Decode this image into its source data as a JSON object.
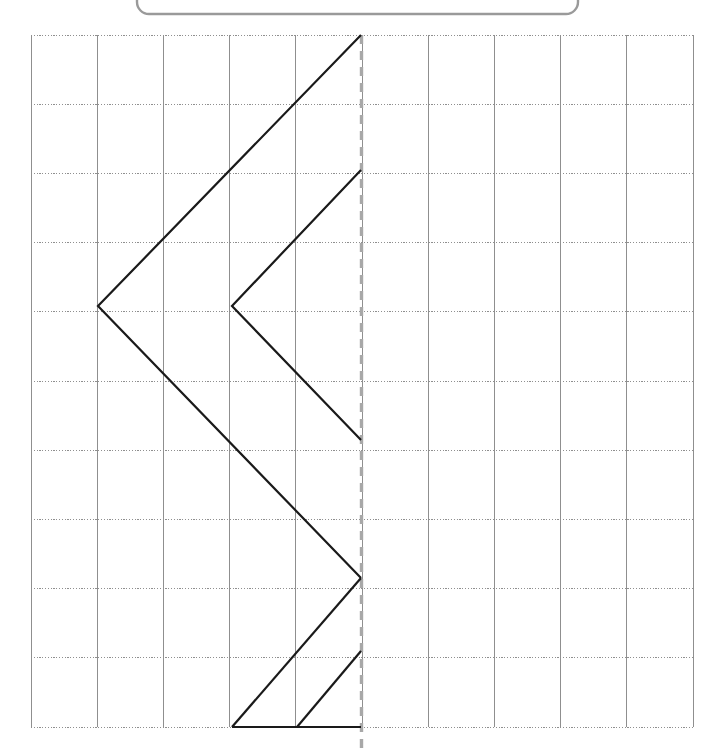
{
  "canvas": {
    "width": 720,
    "height": 750,
    "background": "#ffffff"
  },
  "top_panel": {
    "name": "rounded-panel-bottom-edge",
    "x": 137,
    "y": -34,
    "width": 441,
    "height": 48,
    "corner_radius": 12,
    "stroke": "#9a9a9a",
    "stroke_width": 2.4,
    "fill": "none"
  },
  "grid": {
    "origin_x": 31,
    "origin_y": 35,
    "columns": 10,
    "rows": 10,
    "cell_width": 66.2,
    "cell_height": 69.2,
    "vertical_line_color": "#8f8f8f",
    "vertical_line_width": 1,
    "horizontal_line_color": "#8f8f8f",
    "horizontal_line_width": 1,
    "horizontal_line_style": "dotted",
    "horizontal_dash": "1.2 1.6",
    "vertical_x": [
      31,
      97.2,
      163.4,
      229.6,
      295.8,
      362,
      428.2,
      494.4,
      560.6,
      626.8,
      693
    ],
    "horizontal_y": [
      35,
      104.2,
      173.4,
      242.6,
      311.8,
      381,
      450.2,
      519.4,
      588.6,
      657.8,
      727
    ]
  },
  "mirror_line": {
    "name": "axis-of-symmetry",
    "x": 361.5,
    "y_top": 35,
    "y_bottom": 750,
    "color": "#a8a8a8",
    "stroke_width": 3.4,
    "dash": "9 7"
  },
  "figure": {
    "name": "zigzag-half-shape",
    "stroke": "#1a1a1a",
    "stroke_width": 2.2,
    "fill": "none",
    "paths": [
      {
        "name": "upper-large-chevron",
        "points": [
          [
            361,
            35
          ],
          [
            98,
            306
          ],
          [
            361,
            578
          ]
        ]
      },
      {
        "name": "inner-small-chevron",
        "points": [
          [
            361,
            170
          ],
          [
            232,
            306
          ],
          [
            361,
            440
          ]
        ]
      },
      {
        "name": "lower-tail",
        "points": [
          [
            361,
            578
          ],
          [
            232,
            727
          ]
        ]
      },
      {
        "name": "bottom-base-line",
        "points": [
          [
            232,
            727
          ],
          [
            361,
            727
          ]
        ]
      },
      {
        "name": "bottom-small-diagonal",
        "points": [
          [
            297,
            727
          ],
          [
            361,
            651
          ]
        ]
      }
    ]
  },
  "chart_data": {
    "type": "line",
    "title": "",
    "xlabel": "",
    "ylabel": "",
    "grid": true,
    "x_grid_units": [
      0,
      1,
      2,
      3,
      4,
      5,
      6,
      7,
      8,
      9,
      10
    ],
    "y_grid_units": [
      0,
      1,
      2,
      3,
      4,
      5,
      6,
      7,
      8,
      9,
      10
    ],
    "mirror_axis_x_units": 5,
    "series": [
      {
        "name": "upper-large-chevron",
        "points_units": [
          [
            5,
            0
          ],
          [
            1,
            3.92
          ],
          [
            5,
            7.85
          ]
        ]
      },
      {
        "name": "inner-small-chevron",
        "points_units": [
          [
            5,
            1.95
          ],
          [
            3.03,
            3.92
          ],
          [
            5,
            5.85
          ]
        ]
      },
      {
        "name": "lower-tail",
        "points_units": [
          [
            5,
            7.85
          ],
          [
            3.03,
            10
          ]
        ]
      },
      {
        "name": "bottom-base-line",
        "points_units": [
          [
            3.03,
            10
          ],
          [
            5,
            10
          ]
        ]
      },
      {
        "name": "bottom-small-diagonal",
        "points_units": [
          [
            4.02,
            10
          ],
          [
            5,
            8.9
          ]
        ]
      }
    ]
  }
}
